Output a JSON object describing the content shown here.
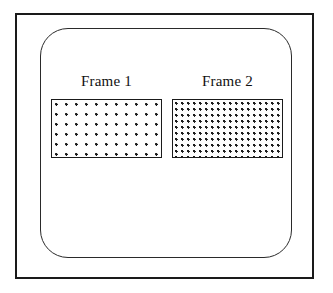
{
  "diagram": {
    "background_color": "#ffffff",
    "stroke_color": "#1a1a1a",
    "outer_border": {
      "name": "outer-rectangle",
      "shape": "rectangle",
      "corner_style": "square"
    },
    "inner_panel": {
      "name": "rounded-rectangle",
      "shape": "rounded-rectangle",
      "corner_style": "rounded"
    },
    "frames": [
      {
        "label": "Frame 1",
        "fill": "sparse-dot-pattern",
        "fill_density": "sparse",
        "fill_color": "#1a1a1a",
        "border_color": "#1a1a1a"
      },
      {
        "label": "Frame 2",
        "fill": "dense-dot-pattern",
        "fill_density": "dense",
        "fill_color": "#1a1a1a",
        "border_color": "#1a1a1a"
      }
    ]
  }
}
